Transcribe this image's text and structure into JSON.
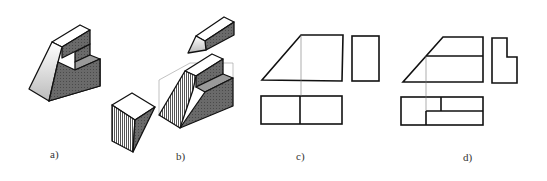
{
  "figure": {
    "panels": [
      {
        "id": "a",
        "label": "a)",
        "description": "Isometric view of stepped block with inclined face"
      },
      {
        "id": "b",
        "label": "b)",
        "description": "Exploded isometric decomposition into three parts"
      },
      {
        "id": "c",
        "label": "c)",
        "description": "Three orthographic views (incomplete)"
      },
      {
        "id": "d",
        "label": "d)",
        "description": "Three orthographic views (complete)"
      }
    ]
  },
  "colors": {
    "line": "#111111",
    "thin_line": "#777777",
    "face_light": "#f6f6f6",
    "face_mid": "#8a8a8a",
    "face_dark": "#555555",
    "background": "#ffffff"
  }
}
